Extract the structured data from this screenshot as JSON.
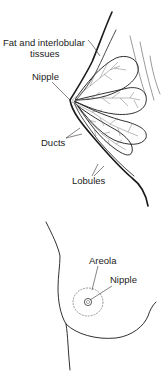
{
  "figure": {
    "type": "anatomical-illustration",
    "panels": [
      {
        "name": "cross-section",
        "labels": [
          {
            "id": "fat",
            "line1": "Fat and interlobular",
            "line2": "tissues"
          },
          {
            "id": "nipple",
            "text": "Nipple"
          },
          {
            "id": "ducts",
            "text": "Ducts"
          },
          {
            "id": "lobules",
            "text": "Lobules"
          }
        ]
      },
      {
        "name": "external-view",
        "labels": [
          {
            "id": "areola",
            "text": "Areola"
          },
          {
            "id": "nipple",
            "text": "Nipple"
          }
        ]
      }
    ]
  }
}
